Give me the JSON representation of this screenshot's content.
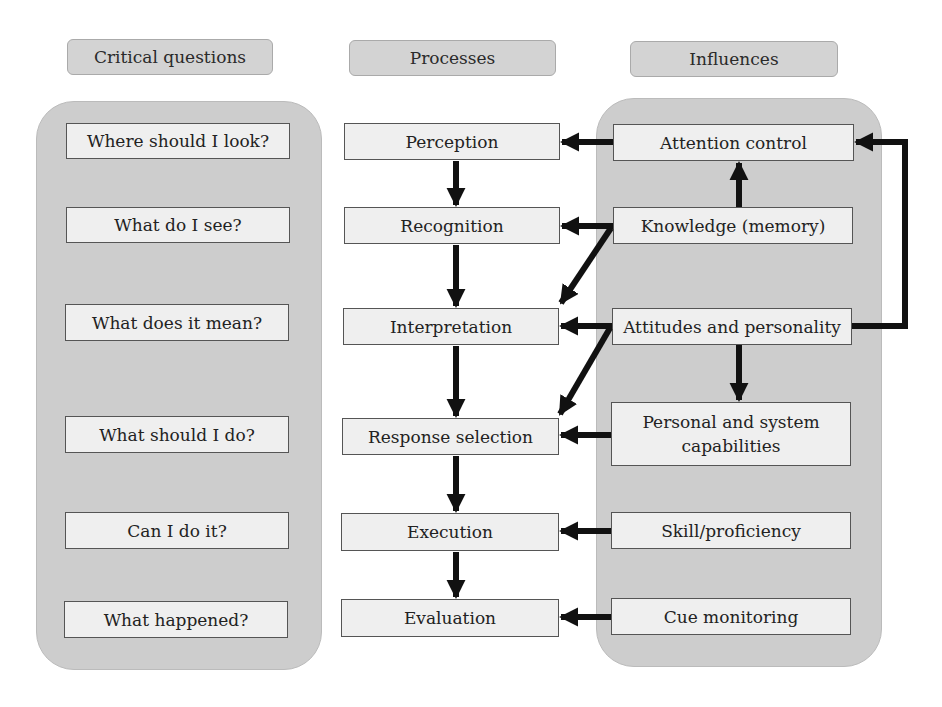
{
  "headers": {
    "critical_questions": "Critical questions",
    "processes": "Processes",
    "influences": "Influences"
  },
  "critical_questions": [
    "Where should I look?",
    "What do I see?",
    "What does it mean?",
    "What should I do?",
    "Can I do it?",
    "What happened?"
  ],
  "processes": [
    "Perception",
    "Recognition",
    "Interpretation",
    "Response selection",
    "Execution",
    "Evaluation"
  ],
  "influences": [
    "Attention control",
    "Knowledge (memory)",
    "Attitudes and personality",
    "Personal and system capabilities",
    "Skill/proficiency",
    "Cue monitoring"
  ],
  "connections": [
    {
      "from": "Perception",
      "to": "Recognition"
    },
    {
      "from": "Recognition",
      "to": "Interpretation"
    },
    {
      "from": "Interpretation",
      "to": "Response selection"
    },
    {
      "from": "Response selection",
      "to": "Execution"
    },
    {
      "from": "Execution",
      "to": "Evaluation"
    },
    {
      "from": "Attention control",
      "to": "Perception"
    },
    {
      "from": "Knowledge (memory)",
      "to": "Attention control"
    },
    {
      "from": "Knowledge (memory)",
      "to": "Recognition"
    },
    {
      "from": "Knowledge (memory)",
      "to": "Interpretation"
    },
    {
      "from": "Attitudes and personality",
      "to": "Interpretation"
    },
    {
      "from": "Attitudes and personality",
      "to": "Response selection"
    },
    {
      "from": "Attitudes and personality",
      "to": "Personal and system capabilities"
    },
    {
      "from": "Attitudes and personality",
      "to": "Attention control"
    },
    {
      "from": "Personal and system capabilities",
      "to": "Response selection"
    },
    {
      "from": "Skill/proficiency",
      "to": "Execution"
    },
    {
      "from": "Cue monitoring",
      "to": "Evaluation"
    }
  ]
}
